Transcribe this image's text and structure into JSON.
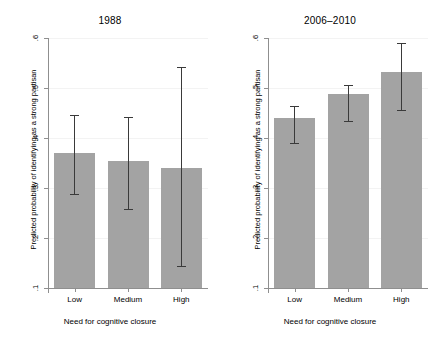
{
  "figure": {
    "type": "bar-with-error-bars",
    "panels": [
      {
        "title": "1988",
        "xlabel": "Need for cognitive closure",
        "ylabel": "Predicted probability of identifying as a strong partisan",
        "categories": [
          "Low",
          "Medium",
          "High"
        ],
        "ytick_labels": [
          ".6",
          ".5",
          ".4",
          ".3",
          ".2",
          ".1"
        ],
        "ytick_values": [
          0.6,
          0.5,
          0.4,
          0.3,
          0.2,
          0.1
        ],
        "ylim": [
          0.1,
          0.6
        ],
        "values": [
          0.37,
          0.355,
          0.341
        ],
        "ci_lower": [
          0.288,
          0.258,
          0.144
        ],
        "ci_upper": [
          0.446,
          0.442,
          0.543
        ]
      },
      {
        "title": "2006–2010",
        "xlabel": "Need for cognitive closure",
        "ylabel": "Predicted probability of identifying as a strong partisan",
        "categories": [
          "Low",
          "Medium",
          "High"
        ],
        "ytick_labels": [
          ".6",
          ".5",
          ".4",
          ".3",
          ".2",
          ".1"
        ],
        "ytick_values": [
          0.6,
          0.5,
          0.4,
          0.3,
          0.2,
          0.1
        ],
        "ylim": [
          0.1,
          0.6
        ],
        "values": [
          0.44,
          0.489,
          0.533
        ],
        "ci_lower": [
          0.39,
          0.434,
          0.456
        ],
        "ci_upper": [
          0.464,
          0.506,
          0.59
        ]
      }
    ]
  },
  "chart_data": {
    "type": "bar",
    "title": "",
    "xlabel": "Need for cognitive closure",
    "ylabel": "Predicted probability of identifying as a strong partisan",
    "categories": [
      "Low",
      "Medium",
      "High"
    ],
    "ylim": [
      0.1,
      0.6
    ],
    "yticks": [
      0.1,
      0.2,
      0.3,
      0.4,
      0.5,
      0.6
    ],
    "ytick_labels": [
      ".1",
      ".2",
      ".3",
      ".4",
      ".5",
      ".6"
    ],
    "grid": false,
    "legend": "none",
    "panel_titles": [
      "1988",
      "2006–2010"
    ],
    "series": [
      {
        "name": "1988",
        "values": [
          0.37,
          0.355,
          0.341
        ],
        "ci_lower": [
          0.288,
          0.258,
          0.144
        ],
        "ci_upper": [
          0.446,
          0.442,
          0.543
        ]
      },
      {
        "name": "2006–2010",
        "values": [
          0.44,
          0.489,
          0.533
        ],
        "ci_lower": [
          0.39,
          0.434,
          0.456
        ],
        "ci_upper": [
          0.464,
          0.506,
          0.59
        ]
      }
    ],
    "bar_color": "#a3a3a3",
    "error_bar_color": "#3a3a3a",
    "axis_color": "#8f8f8f"
  }
}
